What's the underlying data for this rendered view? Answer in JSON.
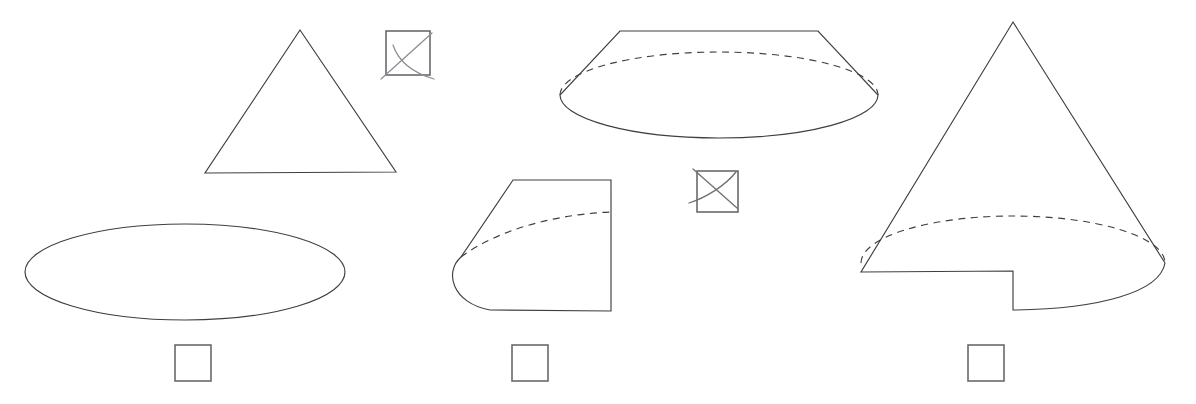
{
  "page": {
    "background_color": "#ffffff",
    "width": 1196,
    "height": 404,
    "line_color": "#3f3f43",
    "checkbox_border_color": "#6a6a6e",
    "check_mark_color": "#8d8d92"
  },
  "shapes": [
    {
      "id": "triangle",
      "name": "triangle-outline",
      "description": "Plain triangle (cone silhouette without base ellipse)",
      "apex": [
        300,
        30
      ],
      "base_left": [
        205,
        173
      ],
      "base_right": [
        396,
        172
      ],
      "has_hidden_edge": false
    },
    {
      "id": "ellipse",
      "name": "ellipse-outline",
      "description": "Flat wide ellipse",
      "center": [
        185,
        272
      ],
      "radius_x": 160,
      "radius_y": 48,
      "has_hidden_edge": false
    },
    {
      "id": "frustum",
      "name": "frustum-outline",
      "description": "Truncated cone (frustum) with dashed hidden base arc",
      "top_left": [
        620,
        31
      ],
      "top_right": [
        818,
        31
      ],
      "base_center": [
        719,
        95
      ],
      "base_radius_x": 159,
      "base_radius_y": 43,
      "has_hidden_edge": true
    },
    {
      "id": "half-frustum",
      "name": "half-frustum-outline",
      "description": "Cone cut by a vertical plane, dashed hidden base arc",
      "top_left": [
        513,
        180
      ],
      "top_right": [
        611,
        180
      ],
      "bottom_right": [
        611,
        311
      ],
      "base_center": [
        573,
        256
      ],
      "base_radius_x": 112,
      "base_radius_y": 55,
      "has_hidden_edge": true
    },
    {
      "id": "notched-cone",
      "name": "notched-cone-outline",
      "description": "Cone with a rectangular notch cut out of its base, dashed hidden base arc",
      "apex": [
        1013,
        22
      ],
      "base_center": [
        1013,
        263
      ],
      "base_radius_x": 152,
      "base_radius_y": 47,
      "notch_left_x": 1013,
      "notch_depth": 39,
      "has_hidden_edge": true
    }
  ],
  "checkboxes": [
    {
      "id": "cb-triangle",
      "name": "checkbox-triangle-option",
      "x": 386,
      "y": 31,
      "size": 44,
      "checked": true,
      "mark": "hand-drawn-cross",
      "label": ""
    },
    {
      "id": "cb-frustum",
      "name": "checkbox-frustum-option",
      "x": 697,
      "y": 171,
      "size": 41,
      "checked": true,
      "mark": "hand-drawn-cross",
      "label": ""
    },
    {
      "id": "cb-ellipse",
      "name": "checkbox-ellipse-option",
      "x": 175,
      "y": 345,
      "size": 36,
      "checked": false,
      "mark": "",
      "label": ""
    },
    {
      "id": "cb-half-frustum",
      "name": "checkbox-half-frustum-option",
      "x": 512,
      "y": 345,
      "size": 36,
      "checked": false,
      "mark": "",
      "label": ""
    },
    {
      "id": "cb-notched-cone",
      "name": "checkbox-notched-cone-option",
      "x": 968,
      "y": 345,
      "size": 36,
      "checked": false,
      "mark": "",
      "label": ""
    }
  ]
}
